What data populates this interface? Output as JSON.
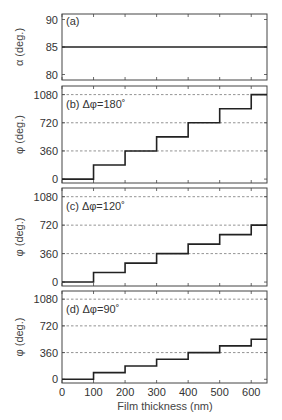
{
  "figure": {
    "xlabel": "Film thickness (nm)",
    "x_ticks": [
      0,
      100,
      200,
      300,
      400,
      500,
      600
    ],
    "x_range": [
      0,
      650
    ]
  },
  "chart_data": [
    {
      "type": "line",
      "panel": "a",
      "title": "(a)",
      "ylabel": "α (deg.)",
      "ylim": [
        79,
        91
      ],
      "y_ticks": [
        80,
        85,
        90
      ],
      "dashed_gridlines": [],
      "x": [
        0,
        650
      ],
      "y": [
        85,
        85
      ]
    },
    {
      "type": "line",
      "panel": "b",
      "title": "(b) Δφ=180˚",
      "ylabel": "φ (deg.)",
      "ylim": [
        -50,
        1190
      ],
      "y_ticks": [
        0,
        360,
        720,
        1080
      ],
      "dashed_gridlines": [
        360,
        720,
        1080
      ],
      "step": true,
      "x": [
        0,
        100,
        200,
        300,
        400,
        500,
        600,
        650
      ],
      "y": [
        0,
        180,
        360,
        540,
        720,
        900,
        1080,
        1080
      ]
    },
    {
      "type": "line",
      "panel": "c",
      "title": "(c) Δφ=120˚",
      "ylabel": "φ (deg.)",
      "ylim": [
        -50,
        1190
      ],
      "y_ticks": [
        0,
        360,
        720,
        1080
      ],
      "dashed_gridlines": [
        360,
        720,
        1080
      ],
      "step": true,
      "x": [
        0,
        100,
        200,
        300,
        400,
        500,
        600,
        650
      ],
      "y": [
        0,
        120,
        240,
        360,
        480,
        600,
        720,
        720
      ]
    },
    {
      "type": "line",
      "panel": "d",
      "title": "(d) Δφ=90˚",
      "ylabel": "φ (deg.)",
      "ylim": [
        -50,
        1190
      ],
      "y_ticks": [
        0,
        360,
        720,
        1080
      ],
      "dashed_gridlines": [
        360,
        720,
        1080
      ],
      "step": true,
      "x": [
        0,
        100,
        200,
        300,
        400,
        500,
        600,
        650
      ],
      "y": [
        0,
        90,
        180,
        270,
        360,
        450,
        540,
        540
      ]
    }
  ]
}
